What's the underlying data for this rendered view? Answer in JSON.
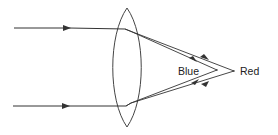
{
  "diagram": {
    "colors": {
      "line": "#333333",
      "background": "#ffffff"
    },
    "labels": {
      "blue": "Blue",
      "red": "Red"
    },
    "elements": {
      "lens": "biconvex-lens",
      "incident_rays": 2,
      "refracted_rays_per_incident": 2,
      "focal_points": [
        "blue-focus",
        "red-focus"
      ]
    }
  }
}
